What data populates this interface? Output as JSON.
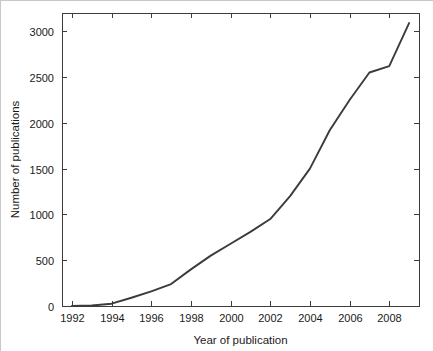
{
  "chart_data": {
    "type": "line",
    "title": "",
    "subtitle": "",
    "xlabel": "Year of publication",
    "ylabel": "Number of publications",
    "x": [
      1992,
      1993,
      1994,
      1995,
      1996,
      1997,
      1998,
      1999,
      2000,
      2001,
      2002,
      2003,
      2004,
      2005,
      2006,
      2007,
      2008,
      2009
    ],
    "series": [
      {
        "name": "Number of publications",
        "color": "#3b3b3b",
        "values": [
          0,
          5,
          25,
          90,
          160,
          240,
          400,
          550,
          680,
          810,
          950,
          1200,
          1500,
          1920,
          2250,
          2550,
          2620,
          3090
        ]
      }
    ],
    "xlim": [
      1991.5,
      2009.5
    ],
    "ylim": [
      0,
      3200
    ],
    "xticks": [
      1992,
      1994,
      1996,
      1998,
      2000,
      2002,
      2004,
      2006,
      2008
    ],
    "xticklabels": [
      "1992",
      "1994",
      "1996",
      "1998",
      "2000",
      "2002",
      "2004",
      "2006",
      "2008"
    ],
    "yticks": [
      0,
      500,
      1000,
      1500,
      2000,
      2500,
      3000
    ],
    "yticklabels": [
      "0",
      "500",
      "1000",
      "1500",
      "2000",
      "2500",
      "3000"
    ],
    "grid": false,
    "legend": false,
    "legend_position": "none",
    "annotations": []
  },
  "axes": {
    "x_title": "Year of publication",
    "y_title": "Number of publications",
    "box_color": "#3c3c3c",
    "background": "#ffffff"
  }
}
